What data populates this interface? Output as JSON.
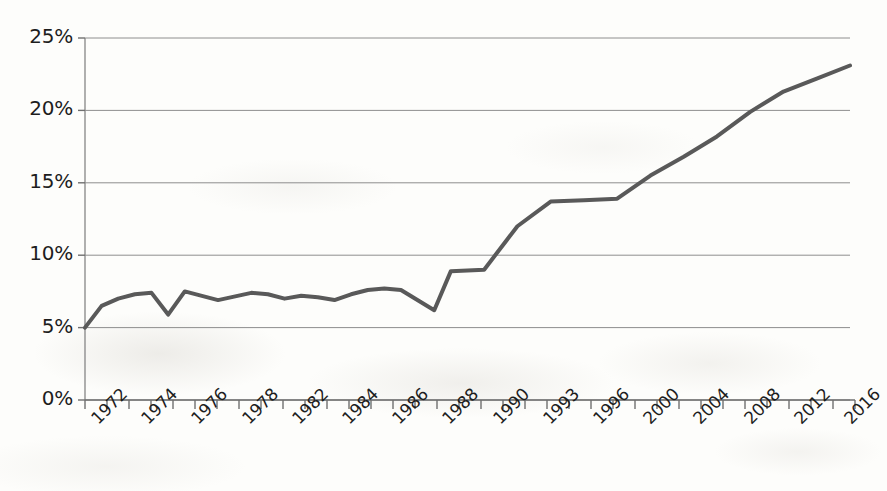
{
  "chart_data": {
    "type": "line",
    "title": "",
    "subtitle": "",
    "xlabel": "",
    "ylabel": "",
    "legend": [],
    "legend_position": "none",
    "grid": true,
    "grid_axis": "y",
    "ylim": [
      0,
      25
    ],
    "y_unit": "%",
    "y_ticks": [
      0,
      5,
      10,
      15,
      20,
      25
    ],
    "y_tick_labels": [
      "0%",
      "5%",
      "10%",
      "15%",
      "20%",
      "25%"
    ],
    "x_tick_labels": [
      "1972",
      "1974",
      "1976",
      "1978",
      "1982",
      "1984",
      "1986",
      "1988",
      "1990",
      "1993",
      "1996",
      "2000",
      "2004",
      "2008",
      "2012",
      "2016"
    ],
    "x_tick_count": 35,
    "line_color": "#595959",
    "line_width": 4,
    "series": [
      {
        "name": "Series 1",
        "x": [
          1972,
          1973,
          1974,
          1975,
          1976,
          1977,
          1978,
          1980,
          1982,
          1983,
          1984,
          1985,
          1986,
          1987,
          1988,
          1989,
          1990,
          1991,
          1993,
          1994,
          1996,
          1998,
          2000,
          2002,
          2004,
          2006,
          2008,
          2010,
          2012,
          2014,
          2016,
          2018
        ],
        "values": [
          5.0,
          6.5,
          7.0,
          7.3,
          7.4,
          5.9,
          7.5,
          6.9,
          7.4,
          7.3,
          7.0,
          7.2,
          7.1,
          6.9,
          7.3,
          7.6,
          7.7,
          7.6,
          6.2,
          8.9,
          9.0,
          12.0,
          13.7,
          13.8,
          13.9,
          15.5,
          16.8,
          18.2,
          19.9,
          21.3,
          22.2,
          23.1
        ]
      }
    ]
  },
  "axes": {
    "x_labels_rotated": true,
    "x_label_rotation_deg": -45
  }
}
